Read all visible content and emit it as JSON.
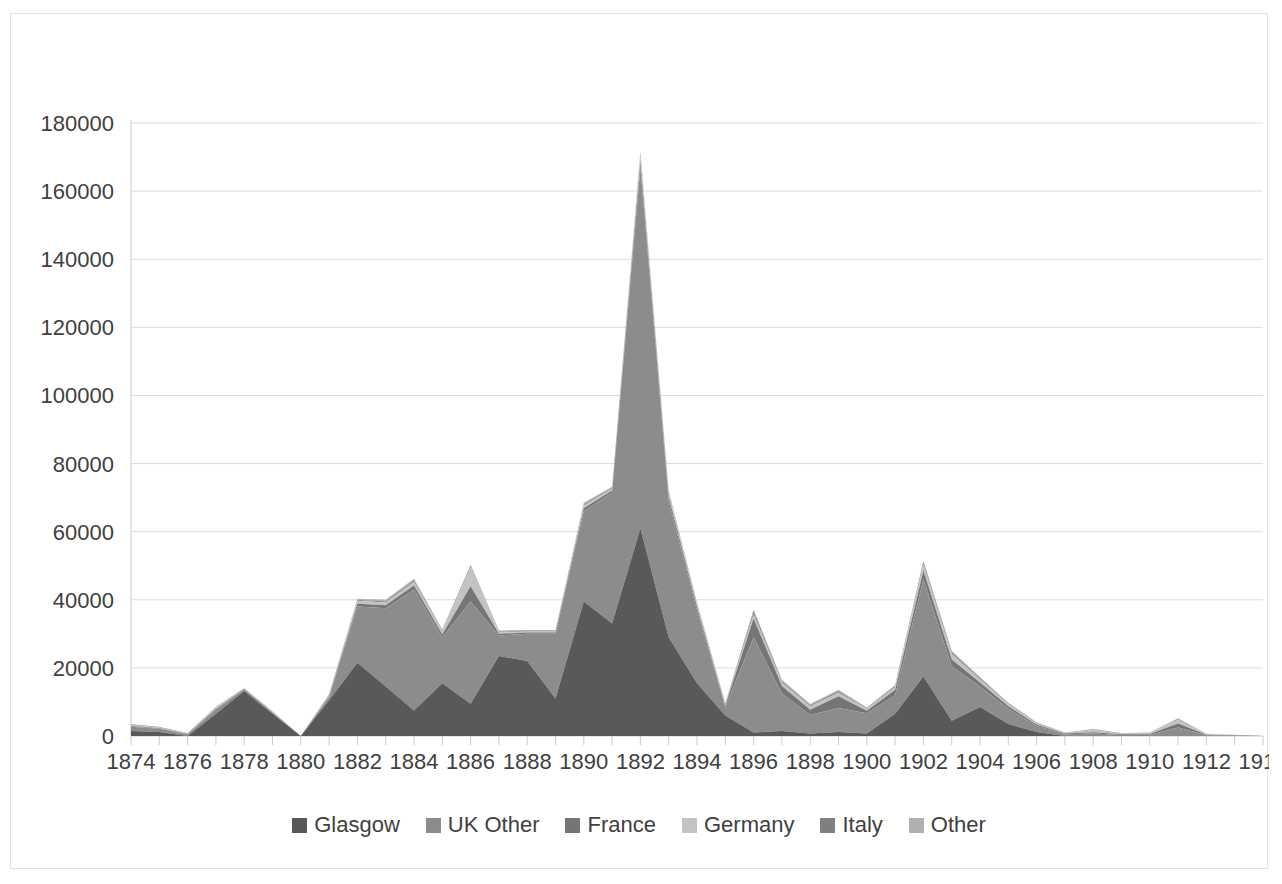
{
  "chart_data": {
    "type": "area",
    "stacked": true,
    "title": "",
    "subtitle": "",
    "xlabel": "",
    "ylabel": "",
    "xlim": [
      1874,
      1914
    ],
    "ylim": [
      0,
      180000
    ],
    "ytick_step": 20000,
    "xtick_label_step": 2,
    "grid": true,
    "legend_position": "bottom",
    "x": [
      1874,
      1875,
      1876,
      1877,
      1878,
      1879,
      1880,
      1881,
      1882,
      1883,
      1884,
      1885,
      1886,
      1887,
      1888,
      1889,
      1890,
      1891,
      1892,
      1893,
      1894,
      1895,
      1896,
      1897,
      1898,
      1899,
      1900,
      1901,
      1902,
      1903,
      1904,
      1905,
      1906,
      1907,
      1908,
      1909,
      1910,
      1911,
      1912,
      1913,
      1914
    ],
    "yticks": [
      0,
      20000,
      40000,
      60000,
      80000,
      100000,
      120000,
      140000,
      160000,
      180000
    ],
    "ytick_labels": [
      "0",
      "20000",
      "40000",
      "60000",
      "80000",
      "100000",
      "120000",
      "140000",
      "160000",
      "180000"
    ],
    "xtick_labels": [
      "1874",
      "1876",
      "1878",
      "1880",
      "1882",
      "1884",
      "1886",
      "1888",
      "1890",
      "1892",
      "1894",
      "1896",
      "1898",
      "1900",
      "1902",
      "1904",
      "1906",
      "1908",
      "1910",
      "1912",
      "1914"
    ],
    "series": [
      {
        "name": "Glasgow",
        "color": "#595959",
        "values": [
          1500,
          1200,
          0,
          6500,
          13200,
          6500,
          0,
          10500,
          21500,
          14500,
          7500,
          15500,
          9500,
          23500,
          22000,
          11000,
          39500,
          33000,
          61000,
          29000,
          15500,
          6000,
          1000,
          1500,
          700,
          1200,
          700,
          6500,
          17500,
          4500,
          8500,
          3500,
          1200,
          0,
          0,
          0,
          0,
          0,
          0,
          0,
          0
        ]
      },
      {
        "name": "UK Other",
        "color": "#8c8c8c",
        "values": [
          1200,
          900,
          500,
          1300,
          500,
          400,
          0,
          1000,
          16500,
          23000,
          35500,
          13500,
          30000,
          6000,
          8000,
          19000,
          26500,
          38500,
          106000,
          40000,
          21500,
          2500,
          28000,
          11000,
          5500,
          7000,
          6000,
          5500,
          28500,
          16000,
          6000,
          4500,
          1800,
          500,
          700,
          300,
          400,
          2500,
          200,
          100,
          0
        ]
      },
      {
        "name": "France",
        "color": "#757575",
        "values": [
          200,
          150,
          100,
          200,
          100,
          100,
          0,
          200,
          800,
          900,
          1200,
          800,
          4500,
          500,
          400,
          400,
          900,
          600,
          1500,
          1200,
          900,
          400,
          5500,
          2200,
          1500,
          3500,
          700,
          1500,
          2500,
          2000,
          1200,
          700,
          400,
          200,
          400,
          200,
          200,
          1200,
          150,
          100,
          0
        ]
      },
      {
        "name": "Germany",
        "color": "#c3c3c3",
        "values": [
          300,
          200,
          150,
          300,
          150,
          150,
          0,
          300,
          900,
          800,
          1000,
          900,
          5500,
          400,
          300,
          300,
          800,
          500,
          2000,
          900,
          700,
          300,
          1200,
          900,
          1000,
          1000,
          500,
          800,
          1800,
          1600,
          900,
          600,
          300,
          150,
          600,
          200,
          250,
          1100,
          150,
          80,
          0
        ]
      },
      {
        "name": "Italy",
        "color": "#7f7f7f",
        "values": [
          100,
          80,
          50,
          100,
          50,
          50,
          0,
          100,
          200,
          300,
          400,
          200,
          300,
          200,
          150,
          150,
          300,
          200,
          400,
          300,
          200,
          150,
          800,
          400,
          300,
          400,
          200,
          300,
          500,
          400,
          300,
          200,
          150,
          80,
          150,
          80,
          80,
          150,
          60,
          40,
          0
        ]
      },
      {
        "name": "Other",
        "color": "#b0b0b0",
        "values": [
          200,
          150,
          100,
          200,
          100,
          100,
          0,
          200,
          400,
          500,
          600,
          400,
          500,
          400,
          300,
          300,
          500,
          400,
          700,
          600,
          400,
          250,
          700,
          500,
          400,
          500,
          300,
          400,
          700,
          500,
          400,
          300,
          200,
          120,
          200,
          120,
          120,
          250,
          80,
          50,
          0
        ]
      }
    ]
  },
  "legend": {
    "items": [
      {
        "label": "Glasgow",
        "color": "#595959"
      },
      {
        "label": "UK Other",
        "color": "#8c8c8c"
      },
      {
        "label": "France",
        "color": "#757575"
      },
      {
        "label": "Germany",
        "color": "#c3c3c3"
      },
      {
        "label": "Italy",
        "color": "#7f7f7f"
      },
      {
        "label": "Other",
        "color": "#b0b0b0"
      }
    ]
  },
  "style": {
    "grid_color": "#dcdcdc",
    "axis_color": "#c9c9c9",
    "border_color": "#e3e3e3",
    "text_color": "#404040",
    "background": "#ffffff"
  }
}
